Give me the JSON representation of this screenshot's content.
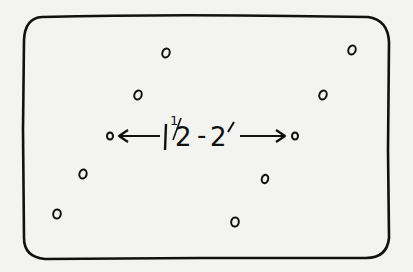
{
  "diagram": {
    "type": "spacing-layout-sketch",
    "frame": {
      "x": 22,
      "y": 16,
      "width": 368,
      "height": 244,
      "radius": 20,
      "stroke": "#111111"
    },
    "background": "#f3f3f1",
    "points": [
      {
        "id": "p1",
        "x": 166,
        "y": 53
      },
      {
        "id": "p2",
        "x": 352,
        "y": 50
      },
      {
        "id": "p3",
        "x": 138,
        "y": 95
      },
      {
        "id": "p4",
        "x": 323,
        "y": 95
      },
      {
        "id": "p5",
        "x": 110,
        "y": 136
      },
      {
        "id": "p6",
        "x": 295,
        "y": 136
      },
      {
        "id": "p7",
        "x": 83,
        "y": 174
      },
      {
        "id": "p8",
        "x": 265,
        "y": 179
      },
      {
        "id": "p9",
        "x": 57,
        "y": 214
      },
      {
        "id": "p10",
        "x": 235,
        "y": 222
      }
    ],
    "dimension": {
      "from": "p5",
      "to": "p6",
      "whole": "1",
      "fraction_num": "1",
      "fraction_den": "2",
      "dash": "-",
      "value_end": "2",
      "unit": "′",
      "full_label": "1½-2′"
    }
  }
}
